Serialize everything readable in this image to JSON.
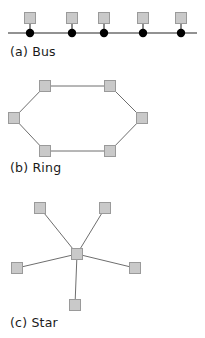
{
  "figure": {
    "background_color": "#ffffff",
    "node_fill": "#c9c9c9",
    "node_stroke": "#9a9a9a",
    "link_color": "#6e6e6e",
    "tap_color": "#000000",
    "caption_color": "#1a1a1a",
    "node_size": 11,
    "panels": [
      {
        "id": "bus",
        "label": "(a) Bus",
        "label_x": 10,
        "label_y": 56,
        "type": "bus",
        "backbone": {
          "x1": 8,
          "y1": 33,
          "x2": 197,
          "y2": 33
        },
        "stations": [
          {
            "name": "bus-node-1",
            "square_x": 30,
            "square_y": 18,
            "tap_x": 30,
            "tap_y": 33
          },
          {
            "name": "bus-node-2",
            "square_x": 72,
            "square_y": 18,
            "tap_x": 72,
            "tap_y": 33
          },
          {
            "name": "bus-node-3",
            "square_x": 104,
            "square_y": 18,
            "tap_x": 104,
            "tap_y": 33
          },
          {
            "name": "bus-node-4",
            "square_x": 143,
            "square_y": 18,
            "tap_x": 143,
            "tap_y": 33
          },
          {
            "name": "bus-node-5",
            "square_x": 181,
            "square_y": 18,
            "tap_x": 181,
            "tap_y": 33
          }
        ],
        "tap_radius": 4.2
      },
      {
        "id": "ring",
        "label": "(b) Ring",
        "label_x": 10,
        "label_y": 172,
        "type": "ring",
        "nodes": [
          {
            "name": "ring-node-top-left",
            "x": 45,
            "y": 86
          },
          {
            "name": "ring-node-top-right",
            "x": 110,
            "y": 86
          },
          {
            "name": "ring-node-right",
            "x": 142,
            "y": 118
          },
          {
            "name": "ring-node-bottom-right",
            "x": 110,
            "y": 151
          },
          {
            "name": "ring-node-bottom-left",
            "x": 45,
            "y": 151
          },
          {
            "name": "ring-node-left",
            "x": 14,
            "y": 118
          }
        ],
        "edges": [
          [
            0,
            1
          ],
          [
            1,
            2
          ],
          [
            2,
            3
          ],
          [
            3,
            4
          ],
          [
            4,
            5
          ],
          [
            5,
            0
          ]
        ]
      },
      {
        "id": "star",
        "label": "(c) Star",
        "label_x": 10,
        "label_y": 327,
        "type": "star",
        "hub": {
          "name": "star-hub-node",
          "x": 77,
          "y": 254
        },
        "leaves": [
          {
            "name": "star-leaf-upper-left",
            "x": 40,
            "y": 208
          },
          {
            "name": "star-leaf-upper-right",
            "x": 105,
            "y": 208
          },
          {
            "name": "star-leaf-left",
            "x": 17,
            "y": 268
          },
          {
            "name": "star-leaf-right",
            "x": 135,
            "y": 268
          },
          {
            "name": "star-leaf-bottom",
            "x": 75,
            "y": 305
          }
        ]
      }
    ]
  }
}
